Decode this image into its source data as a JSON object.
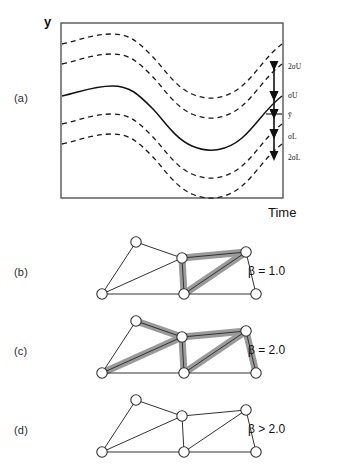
{
  "figure": {
    "panels": [
      {
        "id": "a",
        "label": "(a)"
      },
      {
        "id": "b",
        "label": "(b)"
      },
      {
        "id": "c",
        "label": "(c)"
      },
      {
        "id": "d",
        "label": "(d)"
      }
    ]
  },
  "plot": {
    "ylabel": "y",
    "xlabel": "Time",
    "annotations": {
      "upper_two_sigma": "2σU",
      "upper_sigma": "σU",
      "mean": "ȳ",
      "lower_sigma": "σL",
      "lower_two_sigma": "2σL"
    },
    "frame_color": "#555555",
    "curve_color": "#111111"
  },
  "trusses": [
    {
      "panel": "b",
      "beta_label": "β = 1.0",
      "highlight_color": "#9a9a9a",
      "nodes": [
        {
          "id": "n1",
          "x": 24,
          "y": 62
        },
        {
          "id": "n2",
          "x": 58,
          "y": 10
        },
        {
          "id": "n3",
          "x": 104,
          "y": 26
        },
        {
          "id": "n4",
          "x": 106,
          "y": 62
        },
        {
          "id": "n5",
          "x": 168,
          "y": 20
        },
        {
          "id": "n6",
          "x": 178,
          "y": 62
        }
      ],
      "members": [
        {
          "from": "n1",
          "to": "n2",
          "highlighted": false
        },
        {
          "from": "n2",
          "to": "n3",
          "highlighted": false
        },
        {
          "from": "n1",
          "to": "n3",
          "highlighted": false
        },
        {
          "from": "n1",
          "to": "n4",
          "highlighted": false
        },
        {
          "from": "n3",
          "to": "n4",
          "highlighted": true
        },
        {
          "from": "n3",
          "to": "n5",
          "highlighted": true
        },
        {
          "from": "n4",
          "to": "n5",
          "highlighted": true
        },
        {
          "from": "n5",
          "to": "n6",
          "highlighted": false
        },
        {
          "from": "n4",
          "to": "n6",
          "highlighted": false
        }
      ]
    },
    {
      "panel": "c",
      "beta_label": "β = 2.0",
      "highlight_color": "#9a9a9a",
      "nodes": [
        {
          "id": "n1",
          "x": 24,
          "y": 62
        },
        {
          "id": "n2",
          "x": 58,
          "y": 10
        },
        {
          "id": "n3",
          "x": 104,
          "y": 26
        },
        {
          "id": "n4",
          "x": 106,
          "y": 62
        },
        {
          "id": "n5",
          "x": 168,
          "y": 20
        },
        {
          "id": "n6",
          "x": 178,
          "y": 62
        }
      ],
      "members": [
        {
          "from": "n1",
          "to": "n2",
          "highlighted": false
        },
        {
          "from": "n2",
          "to": "n3",
          "highlighted": true
        },
        {
          "from": "n1",
          "to": "n3",
          "highlighted": true
        },
        {
          "from": "n1",
          "to": "n4",
          "highlighted": false
        },
        {
          "from": "n3",
          "to": "n4",
          "highlighted": true
        },
        {
          "from": "n3",
          "to": "n5",
          "highlighted": true
        },
        {
          "from": "n4",
          "to": "n5",
          "highlighted": true
        },
        {
          "from": "n5",
          "to": "n6",
          "highlighted": true
        },
        {
          "from": "n4",
          "to": "n6",
          "highlighted": false
        }
      ]
    },
    {
      "panel": "d",
      "beta_label": "β > 2.0",
      "highlight_color": "#9a9a9a",
      "nodes": [
        {
          "id": "n1",
          "x": 24,
          "y": 62
        },
        {
          "id": "n2",
          "x": 58,
          "y": 10
        },
        {
          "id": "n3",
          "x": 104,
          "y": 26
        },
        {
          "id": "n4",
          "x": 106,
          "y": 62
        },
        {
          "id": "n5",
          "x": 168,
          "y": 20
        },
        {
          "id": "n6",
          "x": 178,
          "y": 62
        }
      ],
      "members": [
        {
          "from": "n1",
          "to": "n2",
          "highlighted": false
        },
        {
          "from": "n2",
          "to": "n3",
          "highlighted": false
        },
        {
          "from": "n1",
          "to": "n3",
          "highlighted": false
        },
        {
          "from": "n1",
          "to": "n4",
          "highlighted": false
        },
        {
          "from": "n3",
          "to": "n4",
          "highlighted": false
        },
        {
          "from": "n3",
          "to": "n5",
          "highlighted": false
        },
        {
          "from": "n4",
          "to": "n5",
          "highlighted": false
        },
        {
          "from": "n5",
          "to": "n6",
          "highlighted": false
        },
        {
          "from": "n4",
          "to": "n6",
          "highlighted": false
        }
      ]
    }
  ],
  "chart_data": {
    "type": "line",
    "title": "",
    "xlabel": "Time",
    "ylabel": "y",
    "xlim": [
      0,
      100
    ],
    "ylim": [
      0,
      100
    ],
    "grid": false,
    "legend": "none",
    "x": [
      0,
      10,
      20,
      30,
      40,
      50,
      60,
      70,
      80,
      90,
      100
    ],
    "series": [
      {
        "name": "2σU",
        "style": "dashed",
        "offset": 30,
        "values": [
          62,
          60,
          58,
          58,
          62,
          72,
          82,
          88,
          90,
          89,
          87
        ]
      },
      {
        "name": "σU",
        "style": "dashed",
        "offset": 15,
        "values": [
          54,
          52,
          50,
          50,
          54,
          64,
          74,
          80,
          82,
          81,
          79
        ]
      },
      {
        "name": "ȳ",
        "style": "solid",
        "offset": 0,
        "values": [
          42,
          40,
          37,
          36,
          40,
          50,
          60,
          66,
          68,
          67,
          65
        ]
      },
      {
        "name": "σL",
        "style": "dashed",
        "offset": -15,
        "values": [
          30,
          28,
          25,
          24,
          28,
          38,
          48,
          54,
          56,
          55,
          53
        ]
      },
      {
        "name": "2σL",
        "style": "dashed",
        "offset": -30,
        "values": [
          21,
          19,
          16,
          15,
          19,
          29,
          39,
          45,
          47,
          46,
          44
        ]
      }
    ],
    "annotations": [
      {
        "label": "2σU",
        "series": "2σU",
        "at_x": 100
      },
      {
        "label": "σU",
        "series": "σU",
        "at_x": 100
      },
      {
        "label": "ȳ",
        "series": "ȳ",
        "at_x": 100
      },
      {
        "label": "σL",
        "series": "σL",
        "at_x": 100
      },
      {
        "label": "2σL",
        "series": "2σL",
        "at_x": 100
      }
    ]
  }
}
